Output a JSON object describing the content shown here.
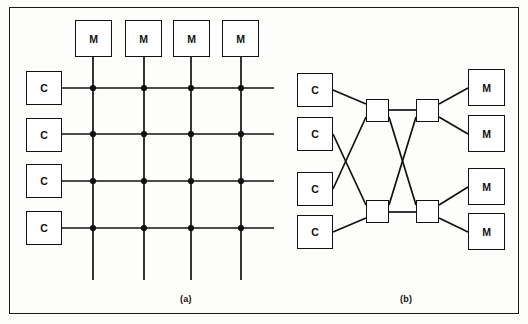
{
  "figure": {
    "background_color": "#fdfdfb",
    "line_color": "#111111",
    "frame": {
      "x": 9,
      "y": 7,
      "width": 510,
      "height": 307
    },
    "panels": [
      {
        "id": "a",
        "caption": "(a)",
        "type": "crossbar-switch",
        "processors": [
          {
            "label": "C",
            "x": 26,
            "y": 71,
            "w": 36,
            "h": 34
          },
          {
            "label": "C",
            "x": 26,
            "y": 118,
            "w": 36,
            "h": 34
          },
          {
            "label": "C",
            "x": 26,
            "y": 164,
            "w": 36,
            "h": 34
          },
          {
            "label": "C",
            "x": 26,
            "y": 211,
            "w": 36,
            "h": 34
          }
        ],
        "memories": [
          {
            "label": "M",
            "x": 75,
            "y": 20,
            "w": 37,
            "h": 37
          },
          {
            "label": "M",
            "x": 125,
            "y": 20,
            "w": 37,
            "h": 37
          },
          {
            "label": "M",
            "x": 173,
            "y": 20,
            "w": 37,
            "h": 37
          },
          {
            "label": "M",
            "x": 222,
            "y": 20,
            "w": 37,
            "h": 37
          }
        ],
        "row_lines_y": [
          88,
          134,
          181,
          228
        ],
        "column_lines_x": [
          93,
          144,
          191,
          241
        ],
        "row_line_x_start": 62,
        "row_line_x_end": 274,
        "column_line_y_start": 57,
        "column_line_y_end": 280,
        "crosspoint_radius": 3.1
      },
      {
        "id": "b",
        "caption": "(b)",
        "type": "omega-multistage-network",
        "processors": [
          {
            "label": "C",
            "x": 297,
            "y": 73,
            "w": 36,
            "h": 34
          },
          {
            "label": "C",
            "x": 297,
            "y": 117,
            "w": 36,
            "h": 34
          },
          {
            "label": "C",
            "x": 297,
            "y": 172,
            "w": 36,
            "h": 34
          },
          {
            "label": "C",
            "x": 297,
            "y": 215,
            "w": 36,
            "h": 34
          }
        ],
        "memories": [
          {
            "label": "M",
            "x": 468,
            "y": 69,
            "w": 37,
            "h": 37
          },
          {
            "label": "M",
            "x": 468,
            "y": 115,
            "w": 37,
            "h": 37
          },
          {
            "label": "M",
            "x": 468,
            "y": 168,
            "w": 37,
            "h": 37
          },
          {
            "label": "M",
            "x": 468,
            "y": 213,
            "w": 37,
            "h": 37
          }
        ],
        "switches": [
          {
            "id": "sw-stage1-top",
            "x": 366,
            "y": 99,
            "w": 23,
            "h": 23
          },
          {
            "id": "sw-stage2-top",
            "x": 416,
            "y": 99,
            "w": 23,
            "h": 23
          },
          {
            "id": "sw-stage1-bottom",
            "x": 366,
            "y": 200,
            "w": 23,
            "h": 23
          },
          {
            "id": "sw-stage2-bottom",
            "x": 416,
            "y": 200,
            "w": 23,
            "h": 23
          }
        ],
        "links": [
          {
            "from": "C1",
            "to": "sw-stage1-top",
            "x1": 333,
            "y1": 90,
            "x2": 366,
            "y2": 104
          },
          {
            "from": "C2",
            "to": "sw-stage1-bottom",
            "x1": 333,
            "y1": 134,
            "x2": 366,
            "y2": 205
          },
          {
            "from": "C3",
            "to": "sw-stage1-top",
            "x1": 333,
            "y1": 189,
            "x2": 366,
            "y2": 117
          },
          {
            "from": "C4",
            "to": "sw-stage1-bottom",
            "x1": 333,
            "y1": 232,
            "x2": 366,
            "y2": 218
          },
          {
            "from": "sw-stage1-top",
            "to": "sw-stage2-top",
            "x1": 389,
            "y1": 110,
            "x2": 416,
            "y2": 110
          },
          {
            "from": "sw-stage1-top",
            "to": "sw-stage2-bottom",
            "x1": 389,
            "y1": 117,
            "x2": 416,
            "y2": 205
          },
          {
            "from": "sw-stage1-bottom",
            "to": "sw-stage2-top",
            "x1": 389,
            "y1": 205,
            "x2": 416,
            "y2": 117
          },
          {
            "from": "sw-stage1-bottom",
            "to": "sw-stage2-bottom",
            "x1": 389,
            "y1": 212,
            "x2": 416,
            "y2": 212
          },
          {
            "from": "sw-stage2-top",
            "to": "M1",
            "x1": 439,
            "y1": 104,
            "x2": 468,
            "y2": 88
          },
          {
            "from": "sw-stage2-top",
            "to": "M2",
            "x1": 439,
            "y1": 117,
            "x2": 468,
            "y2": 134
          },
          {
            "from": "sw-stage2-bottom",
            "to": "M3",
            "x1": 439,
            "y1": 205,
            "x2": 468,
            "y2": 187
          },
          {
            "from": "sw-stage2-bottom",
            "to": "M4",
            "x1": 439,
            "y1": 218,
            "x2": 468,
            "y2": 232
          }
        ]
      }
    ]
  }
}
